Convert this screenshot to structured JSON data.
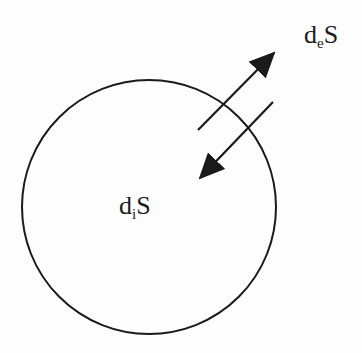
{
  "diagram": {
    "type": "entropy-flow",
    "stroke_color": "#1a1a1a",
    "background": "#fdfdfd",
    "system_boundary": {
      "shape": "circle",
      "cx": 149,
      "cy": 207,
      "r": 127
    },
    "labels": {
      "exchange": {
        "base": "d",
        "sub": "e",
        "tail": "S"
      },
      "internal": {
        "base": "d",
        "sub": "i",
        "tail": "S"
      }
    },
    "arrows": [
      {
        "name": "outward-exchange-arrow",
        "x1": 198,
        "y1": 130,
        "x2": 274,
        "y2": 53
      },
      {
        "name": "inward-exchange-arrow",
        "x1": 273,
        "y1": 102,
        "x2": 200,
        "y2": 178
      }
    ]
  }
}
